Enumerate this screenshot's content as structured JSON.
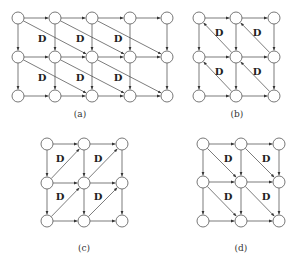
{
  "figure": {
    "node_radius": 6,
    "delay_label": "D",
    "panels": [
      {
        "id": "a",
        "caption": "(a)",
        "caption_pos": [
          80,
          117
        ],
        "cols": [
          18,
          55,
          92,
          130,
          167
        ],
        "rows": [
          18,
          57,
          96
        ],
        "diagonal": {
          "dr": 1,
          "dc": 2,
          "reverse": false
        },
        "labels": [
          [
            42,
            42
          ],
          [
            80,
            42
          ],
          [
            118,
            42
          ],
          [
            42,
            81
          ],
          [
            80,
            81
          ],
          [
            118,
            81
          ]
        ]
      },
      {
        "id": "b",
        "caption": "(b)",
        "caption_pos": [
          237,
          117
        ],
        "cols": [
          199,
          236,
          274
        ],
        "rows": [
          18,
          57,
          96
        ],
        "diagonal": {
          "dr": 1,
          "dc": 1,
          "reverse": true
        },
        "labels": [
          [
            219,
            36
          ],
          [
            257,
            36
          ],
          [
            219,
            75
          ],
          [
            257,
            75
          ]
        ]
      },
      {
        "id": "c",
        "caption": "(c)",
        "caption_pos": [
          84,
          251
        ],
        "cols": [
          47,
          84,
          122
        ],
        "rows": [
          144,
          183,
          221
        ],
        "diagonal": {
          "dr": 1,
          "dc": 1,
          "reverse": true,
          "anti": true
        },
        "labels": [
          [
            60,
            162
          ],
          [
            98,
            162
          ],
          [
            60,
            200
          ],
          [
            98,
            200
          ]
        ]
      },
      {
        "id": "d",
        "caption": "(d)",
        "caption_pos": [
          241,
          251
        ],
        "cols": [
          203,
          241,
          279
        ],
        "rows": [
          144,
          182,
          221
        ],
        "diagonal": {
          "dr": 1,
          "dc": 1,
          "reverse": false
        },
        "labels": [
          [
            228,
            162
          ],
          [
            266,
            162
          ],
          [
            228,
            200
          ],
          [
            266,
            200
          ]
        ]
      }
    ]
  }
}
